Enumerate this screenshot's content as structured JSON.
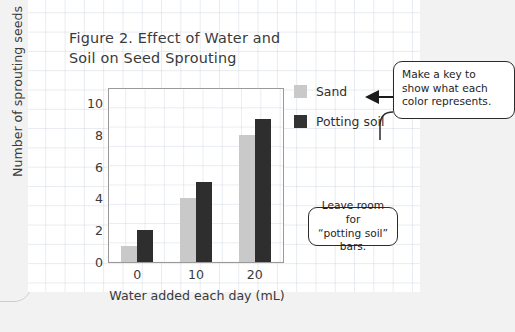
{
  "title": "Figure 2. Effect of Water and\nSoil on Seed Sprouting",
  "chart_data": {
    "type": "bar",
    "title": "Figure 2. Effect of Water and Soil on Seed Sprouting",
    "xlabel": "Water added each day (mL)",
    "ylabel": "Number of sprouting seeds",
    "categories": [
      "0",
      "10",
      "20"
    ],
    "series": [
      {
        "name": "Sand",
        "color": "#c9c9c9",
        "values": [
          1,
          4,
          8
        ]
      },
      {
        "name": "Potting soil",
        "color": "#2e2e2e",
        "values": [
          2,
          5,
          9
        ]
      }
    ],
    "ylim": [
      0,
      11
    ],
    "yticks": [
      "0",
      "2",
      "4",
      "6",
      "8",
      "10"
    ],
    "ytick_values": [
      0,
      2,
      4,
      6,
      8,
      10
    ],
    "xticks": [
      "0",
      "10",
      "20"
    ],
    "grid": true,
    "legend_position": "right"
  },
  "legend": {
    "items": [
      {
        "label": "Sand",
        "color": "#c9c9c9"
      },
      {
        "label": "Potting soil",
        "color": "#333333"
      }
    ]
  },
  "annotations": {
    "key_note": "Make a key to\nshow what each\ncolor represents.",
    "room_note": "Leave room for\n“potting soil” bars."
  },
  "colors": {
    "sand": "#c9c9c9",
    "potting_soil": "#2e2e2e",
    "grid_line": "#b0becd",
    "page_background": "#f2f2f2",
    "card_background": "#ffffff",
    "ink": "#2b2b2b"
  }
}
